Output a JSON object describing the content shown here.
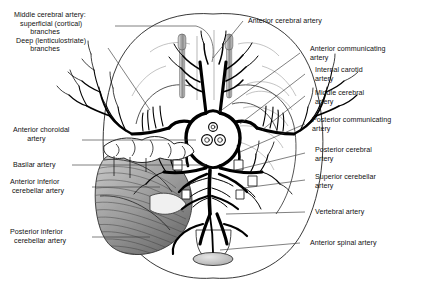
{
  "figure": {
    "view": "inferior surface of the brain with cerebellum and brainstem",
    "background_color": "#ffffff",
    "ink_color": "#111111",
    "artery_color": "#000000",
    "cerebellum_shade": "#8d8d8d",
    "olfactory_shade": "#9a9a9a"
  },
  "labels": {
    "left": [
      {
        "id": "middle-cerebral-artery",
        "lines": [
          "Middle cerebral artery:",
          "superficial (cortical)",
          "branches",
          "Deep (lenticulostriate)",
          "branches"
        ],
        "text": "Middle cerebral artery:\n   superficial (cortical)\n        branches\n Deep (lenticulostriate)\n        branches"
      },
      {
        "id": "anterior-choroidal-artery",
        "text": "Anterior choroidal\n       artery"
      },
      {
        "id": "basilar-artery",
        "text": "Basilar artery"
      },
      {
        "id": "anterior-inferior-cerebellar-artery",
        "text": "Anterior inferior\n cerebellar artery"
      },
      {
        "id": "posterior-inferior-cerebellar-artery",
        "text": "Posterior inferior\n  cerebellar artery"
      }
    ],
    "right": [
      {
        "id": "anterior-cerebral-artery",
        "text": "Anterior cerebral artery"
      },
      {
        "id": "anterior-communicating-artery",
        "text": "Anterior communicating\nartery"
      },
      {
        "id": "internal-carotid-artery",
        "text": "Internal carotid\nartery"
      },
      {
        "id": "middle-cerebral-artery-right",
        "text": "Middle cerebral\nartery"
      },
      {
        "id": "posterior-communicating-artery",
        "text": "Posterior communicating\nartery"
      },
      {
        "id": "posterior-cerebral-artery",
        "text": "Posterior cerebral\nartery"
      },
      {
        "id": "superior-cerebellar-artery",
        "text": "Superior cerebellar\nartery"
      },
      {
        "id": "vertebral-artery",
        "text": "Vertebral artery"
      },
      {
        "id": "anterior-spinal-artery",
        "text": "Anterior spinal artery"
      }
    ]
  }
}
